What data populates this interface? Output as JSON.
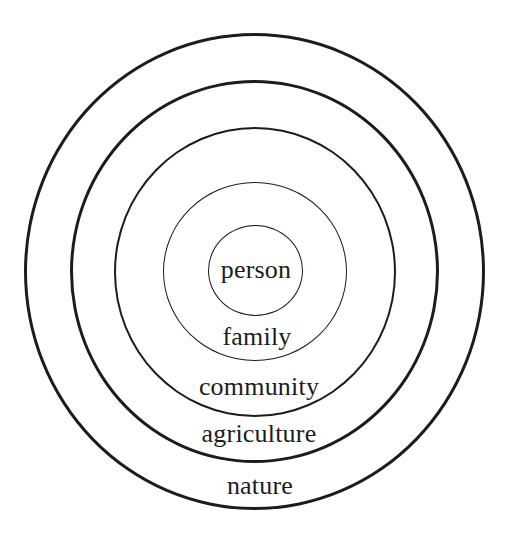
{
  "diagram": {
    "type": "concentric-circles",
    "rings": [
      {
        "label": "nature"
      },
      {
        "label": "agriculture"
      },
      {
        "label": "community"
      },
      {
        "label": "family"
      },
      {
        "label": "person"
      }
    ],
    "ink_color": "#1c1c1c",
    "background_color": "#ffffff"
  }
}
